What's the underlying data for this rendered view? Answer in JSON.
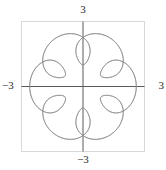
{
  "figure": {
    "kind": "parametric-plot",
    "background_color": "#ffffff",
    "frame_color": "#d8d8d8",
    "axis_color": "#5a5a5a",
    "curve_color": "#8a8a8a",
    "label_color": "#2b2b2b"
  },
  "labels": {
    "top": "3",
    "bottom": "−3",
    "left": "−3",
    "right": "3"
  },
  "chart_data": {
    "type": "line",
    "title": "",
    "subtitle": "",
    "xlabel": "",
    "ylabel": "",
    "xlim": [
      -3,
      3
    ],
    "ylim": [
      -3,
      3
    ],
    "xticks": [
      -3,
      3
    ],
    "yticks": [
      -3,
      3
    ],
    "xticklabels": [
      "−3",
      "3"
    ],
    "yticklabels": [
      "−3",
      "3"
    ],
    "grid": false,
    "legend": null,
    "legend_position": "none",
    "axes_through_origin": true,
    "frame": true,
    "aspect": "equal",
    "series": [
      {
        "name": "curve",
        "parametric": true,
        "param": "t",
        "t_range": [
          0,
          12.566370614
        ],
        "n_points": 1200,
        "r_formula": "1.8 + 0.8*cos(6*t)",
        "x_formula": "(1.8 + 0.8*cos(6*t)) * cos(t + 0.45*sin(6*t))",
        "y_formula": "(1.8 + 0.8*cos(6*t)) * sin(t + 0.45*sin(6*t))",
        "color": "#8a8a8a",
        "linewidth": 0.7,
        "r_max": 2.6,
        "r_min": 1.0,
        "symmetry_order": 12,
        "outer_lobes": 12,
        "inner_points": 12
      }
    ]
  }
}
